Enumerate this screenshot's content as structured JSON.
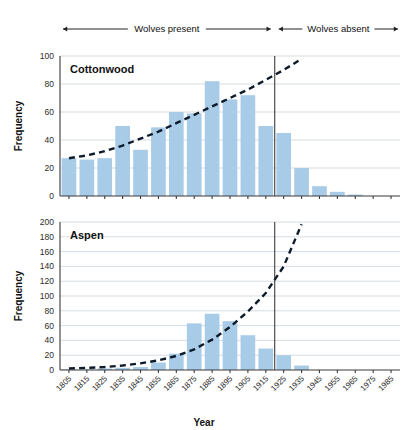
{
  "figure": {
    "x_axis_title": "Year",
    "y_axis_title": "Frequency",
    "annotation": {
      "left_label": "Wolves present",
      "right_label": "Wolves absent",
      "divider_year": 1925
    }
  },
  "chart_data": [
    {
      "type": "bar",
      "title": "Cottonwood",
      "xlabel": "Year",
      "ylabel": "Frequency",
      "ylim": [
        0,
        100
      ],
      "yticks": [
        0,
        20,
        40,
        60,
        80,
        100
      ],
      "grid": true,
      "legend": "none",
      "categories": [
        "1805",
        "1815",
        "1825",
        "1835",
        "1845",
        "1855",
        "1865",
        "1875",
        "1885",
        "1895",
        "1905",
        "1915",
        "1925",
        "1935",
        "1945",
        "1955",
        "1965",
        "1975",
        "1985"
      ],
      "values": [
        27,
        26,
        27,
        50,
        33,
        49,
        60,
        59,
        82,
        69,
        72,
        50,
        45,
        20,
        7,
        3,
        1,
        0,
        0
      ],
      "series": [
        {
          "name": "Cottonwood establishment frequency",
          "values": [
            27,
            26,
            27,
            50,
            33,
            49,
            60,
            59,
            82,
            69,
            72,
            50,
            45,
            20,
            7,
            3,
            1,
            0,
            0
          ]
        }
      ],
      "trend_line": {
        "name": "fitted trend",
        "style": "dashed",
        "color": "#0d1b2a",
        "x": [
          "1805",
          "1815",
          "1825",
          "1835",
          "1845",
          "1855",
          "1865",
          "1875",
          "1885",
          "1895",
          "1905",
          "1915",
          "1925",
          "1935"
        ],
        "y": [
          27,
          29,
          32,
          36,
          41,
          46,
          52,
          58,
          64,
          70,
          76,
          83,
          90,
          98
        ]
      }
    },
    {
      "type": "bar",
      "title": "Aspen",
      "xlabel": "Year",
      "ylabel": "Frequency",
      "ylim": [
        0,
        200
      ],
      "yticks": [
        0,
        20,
        40,
        60,
        80,
        100,
        120,
        140,
        160,
        180,
        200
      ],
      "grid": true,
      "legend": "none",
      "categories": [
        "1805",
        "1815",
        "1825",
        "1835",
        "1845",
        "1855",
        "1865",
        "1875",
        "1885",
        "1895",
        "1905",
        "1915",
        "1925",
        "1935",
        "1945",
        "1955",
        "1965",
        "1975",
        "1985"
      ],
      "values": [
        1,
        1,
        2,
        3,
        4,
        10,
        22,
        63,
        76,
        66,
        47,
        29,
        20,
        6,
        0,
        0,
        0,
        0,
        0
      ],
      "series": [
        {
          "name": "Aspen establishment frequency",
          "values": [
            1,
            1,
            2,
            3,
            4,
            10,
            22,
            63,
            76,
            66,
            47,
            29,
            20,
            6,
            0,
            0,
            0,
            0,
            0
          ]
        }
      ],
      "trend_line": {
        "name": "fitted trend",
        "style": "dashed",
        "color": "#0d1b2a",
        "x": [
          "1805",
          "1815",
          "1825",
          "1835",
          "1845",
          "1855",
          "1865",
          "1875",
          "1885",
          "1895",
          "1905",
          "1915",
          "1925",
          "1935"
        ],
        "y": [
          2,
          3,
          4,
          6,
          9,
          13,
          19,
          28,
          41,
          58,
          79,
          104,
          140,
          197
        ]
      }
    }
  ],
  "colors": {
    "bar_fill": "#a8cbe8",
    "trend": "#0d1b2a",
    "grid": "#b9c6d2",
    "axis": "#3a3a3a",
    "divider": "#2a2a2a",
    "text": "#111111"
  }
}
